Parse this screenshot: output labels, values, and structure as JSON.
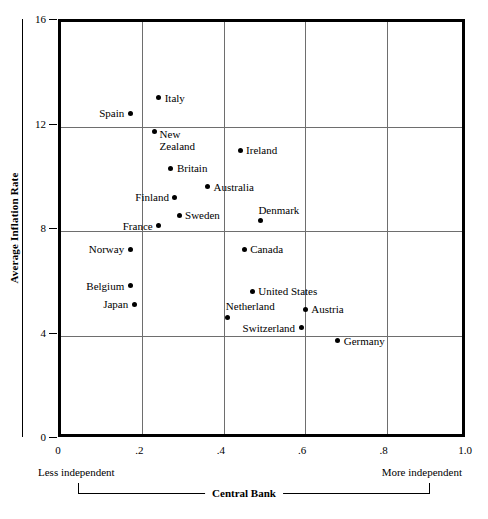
{
  "chart_data": {
    "type": "scatter",
    "title": "",
    "xlabel": "Central Bank",
    "ylabel": "Average Inflation Rate",
    "xlim": [
      0,
      1.0
    ],
    "ylim": [
      0,
      16
    ],
    "grid": true,
    "legend_position": "none",
    "xticks": [
      "0",
      ".2",
      ".4",
      ".6",
      ".8",
      "1.0"
    ],
    "xtick_values": [
      0,
      0.2,
      0.4,
      0.6,
      0.8,
      1.0
    ],
    "yticks": [
      "0",
      "4",
      "8",
      "12",
      "16"
    ],
    "ytick_values": [
      0,
      4,
      8,
      12,
      16
    ],
    "annotations": {
      "x_axis_left_anchor": "Less independent",
      "x_axis_right_anchor": "More independent"
    },
    "points": [
      {
        "label": "Italy",
        "x": 0.24,
        "y": 13.1,
        "label_pos": "right"
      },
      {
        "label": "Spain",
        "x": 0.17,
        "y": 12.5,
        "label_pos": "left"
      },
      {
        "label": "New Zealand",
        "x": 0.23,
        "y": 11.8,
        "label_pos": "right-two-line"
      },
      {
        "label": "Ireland",
        "x": 0.44,
        "y": 11.1,
        "label_pos": "right"
      },
      {
        "label": "Britain",
        "x": 0.27,
        "y": 10.4,
        "label_pos": "right"
      },
      {
        "label": "Australia",
        "x": 0.36,
        "y": 9.7,
        "label_pos": "right"
      },
      {
        "label": "Finland",
        "x": 0.28,
        "y": 9.3,
        "label_pos": "left"
      },
      {
        "label": "Sweden",
        "x": 0.29,
        "y": 8.6,
        "label_pos": "right"
      },
      {
        "label": "Denmark",
        "x": 0.49,
        "y": 8.4,
        "label_pos": "above-right"
      },
      {
        "label": "France",
        "x": 0.24,
        "y": 8.2,
        "label_pos": "left"
      },
      {
        "label": "Norway",
        "x": 0.17,
        "y": 7.3,
        "label_pos": "left"
      },
      {
        "label": "Canada",
        "x": 0.45,
        "y": 7.3,
        "label_pos": "right"
      },
      {
        "label": "Belgium",
        "x": 0.17,
        "y": 5.9,
        "label_pos": "left"
      },
      {
        "label": "United States",
        "x": 0.47,
        "y": 5.7,
        "label_pos": "right"
      },
      {
        "label": "Japan",
        "x": 0.18,
        "y": 5.2,
        "label_pos": "left"
      },
      {
        "label": "Austria",
        "x": 0.6,
        "y": 5.0,
        "label_pos": "right"
      },
      {
        "label": "Netherland",
        "x": 0.41,
        "y": 4.7,
        "label_pos": "above-right"
      },
      {
        "label": "Switzerland",
        "x": 0.59,
        "y": 4.3,
        "label_pos": "left"
      },
      {
        "label": "Germany",
        "x": 0.68,
        "y": 3.8,
        "label_pos": "right"
      }
    ]
  }
}
